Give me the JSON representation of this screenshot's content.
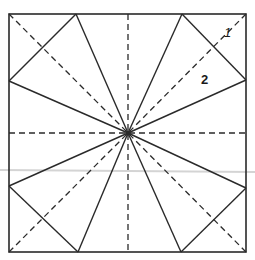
{
  "diagram": {
    "type": "origami fold diagram",
    "colors": {
      "line": "#2a2a2a",
      "background": "#ffffff",
      "scan_artifact": "#d4d4d4"
    },
    "square": {
      "x1": 9,
      "y1": 14,
      "x2": 246,
      "y2": 252
    },
    "center": {
      "x": 128,
      "y": 133
    },
    "labels": [
      {
        "id": "label-1",
        "text": "1",
        "x": 224,
        "y": 37
      },
      {
        "id": "label-2",
        "text": "2",
        "x": 201,
        "y": 84
      }
    ],
    "dashed_lines": [
      {
        "name": "diagonal-top-left",
        "x1": 9,
        "y1": 14,
        "x2": 128,
        "y2": 133
      },
      {
        "name": "diagonal-top-right",
        "x1": 246,
        "y1": 14,
        "x2": 128,
        "y2": 133
      },
      {
        "name": "diagonal-bottom-left",
        "x1": 9,
        "y1": 252,
        "x2": 128,
        "y2": 133
      },
      {
        "name": "diagonal-bottom-right",
        "x1": 246,
        "y1": 252,
        "x2": 128,
        "y2": 133
      },
      {
        "name": "vertical-center",
        "x1": 128,
        "y1": 14,
        "x2": 128,
        "y2": 252
      },
      {
        "name": "horizontal-center",
        "x1": 9,
        "y1": 133,
        "x2": 246,
        "y2": 133
      }
    ],
    "solid_lines": [
      {
        "name": "ray-top-left",
        "x1": 128,
        "y1": 133,
        "x2": 76,
        "y2": 14
      },
      {
        "name": "ray-top-right",
        "x1": 128,
        "y1": 133,
        "x2": 182,
        "y2": 14
      },
      {
        "name": "ray-right-top",
        "x1": 128,
        "y1": 133,
        "x2": 246,
        "y2": 80
      },
      {
        "name": "ray-right-bottom",
        "x1": 128,
        "y1": 133,
        "x2": 246,
        "y2": 188
      },
      {
        "name": "ray-bottom-right",
        "x1": 128,
        "y1": 133,
        "x2": 181,
        "y2": 252
      },
      {
        "name": "ray-bottom-left",
        "x1": 128,
        "y1": 133,
        "x2": 78,
        "y2": 252
      },
      {
        "name": "ray-left-bottom",
        "x1": 128,
        "y1": 133,
        "x2": 9,
        "y2": 186
      },
      {
        "name": "ray-left-top",
        "x1": 128,
        "y1": 133,
        "x2": 9,
        "y2": 81
      },
      {
        "name": "corner-fold-top-left",
        "x1": 76,
        "y1": 14,
        "x2": 9,
        "y2": 81
      },
      {
        "name": "corner-fold-top-right",
        "x1": 182,
        "y1": 14,
        "x2": 246,
        "y2": 80
      },
      {
        "name": "corner-fold-bottom-right",
        "x1": 246,
        "y1": 188,
        "x2": 181,
        "y2": 252
      },
      {
        "name": "corner-fold-bottom-left",
        "x1": 9,
        "y1": 186,
        "x2": 78,
        "y2": 252
      }
    ],
    "artifact_line": {
      "x1": 0,
      "y1": 170,
      "x2": 255,
      "y2": 172
    }
  }
}
